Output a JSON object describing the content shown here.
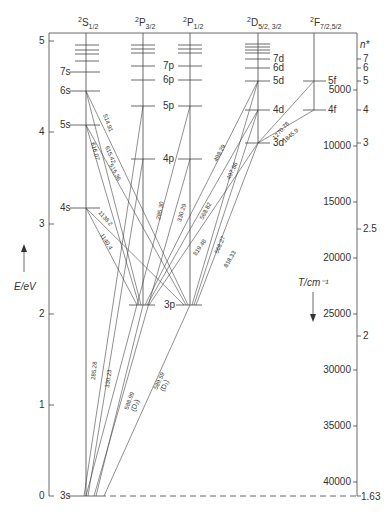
{
  "diagram": {
    "columns": [
      {
        "id": "S",
        "label": "2S1/2",
        "sup": "2",
        "main": "S",
        "sub": "1/2",
        "x": 86
      },
      {
        "id": "P32",
        "label": "2P3/2",
        "sup": "2",
        "main": "P",
        "sub": "3/2",
        "x": 143
      },
      {
        "id": "P12",
        "label": "2P1/2",
        "sup": "2",
        "main": "P",
        "sub": "1/2",
        "x": 190
      },
      {
        "id": "D",
        "label": "2D5/2,3/2",
        "sup": "2",
        "main": "D",
        "sub": "5/2, 3/2",
        "x": 258
      },
      {
        "id": "F",
        "label": "2F7/2,5/2",
        "sup": "2",
        "main": "F",
        "sub": "7/2,5/2",
        "x": 314
      }
    ],
    "levels": [
      {
        "name": "3s",
        "col": "S",
        "y": 496
      },
      {
        "name": "4s",
        "col": "S",
        "y": 208
      },
      {
        "name": "5s",
        "col": "S",
        "y": 125
      },
      {
        "name": "6s",
        "col": "S",
        "y": 91
      },
      {
        "name": "7s",
        "col": "S",
        "y": 72
      },
      {
        "name": "3p",
        "col": "P",
        "y": 305
      },
      {
        "name": "4p",
        "col": "P",
        "y": 159
      },
      {
        "name": "5p",
        "col": "P",
        "y": 106
      },
      {
        "name": "6p",
        "col": "P",
        "y": 80
      },
      {
        "name": "7p",
        "col": "P",
        "y": 66
      },
      {
        "name": "3d",
        "col": "D",
        "y": 143
      },
      {
        "name": "4d",
        "col": "D",
        "y": 110
      },
      {
        "name": "5d",
        "col": "D",
        "y": 81
      },
      {
        "name": "6d",
        "col": "D",
        "y": 68
      },
      {
        "name": "7d",
        "col": "D",
        "y": 59
      },
      {
        "name": "4f",
        "col": "F",
        "y": 110
      },
      {
        "name": "5f",
        "col": "F",
        "y": 81
      }
    ],
    "transitions_nm": [
      "514.91",
      "615.42",
      "616.07",
      "515.36",
      "1138.2",
      "1140.4",
      "285.30",
      "330.29",
      "285.28",
      "330.23",
      "588.99 (D2)",
      "589.59 (D1)",
      "498.29",
      "497.86",
      "568.82",
      "568.27",
      "819.48",
      "818.33",
      "1270.78",
      "1845.9"
    ],
    "left_axis": {
      "label": "E/eV",
      "ticks": [
        {
          "v": "0",
          "y": 496
        },
        {
          "v": "1",
          "y": 405
        },
        {
          "v": "2",
          "y": 314
        },
        {
          "v": "3",
          "y": 224
        },
        {
          "v": "4",
          "y": 132
        },
        {
          "v": "5",
          "y": 41
        }
      ]
    },
    "right_axis": {
      "label": "T/cm⁻¹",
      "nstar_label": "n*",
      "wavenumber_ticks": [
        {
          "v": "5000",
          "y": 90
        },
        {
          "v": "10000",
          "y": 146
        },
        {
          "v": "15000",
          "y": 202
        },
        {
          "v": "20000",
          "y": 258
        },
        {
          "v": "25000",
          "y": 314
        },
        {
          "v": "30000",
          "y": 370
        },
        {
          "v": "35000",
          "y": 426
        },
        {
          "v": "40000",
          "y": 482
        }
      ],
      "nstar_ticks": [
        {
          "v": "7",
          "y": 59
        },
        {
          "v": "6",
          "y": 68
        },
        {
          "v": "5",
          "y": 81
        },
        {
          "v": "4",
          "y": 110
        },
        {
          "v": "3",
          "y": 143
        },
        {
          "v": "2.5",
          "y": 229
        },
        {
          "v": "2",
          "y": 336
        },
        {
          "v": "1.63",
          "y": 496
        }
      ]
    }
  }
}
